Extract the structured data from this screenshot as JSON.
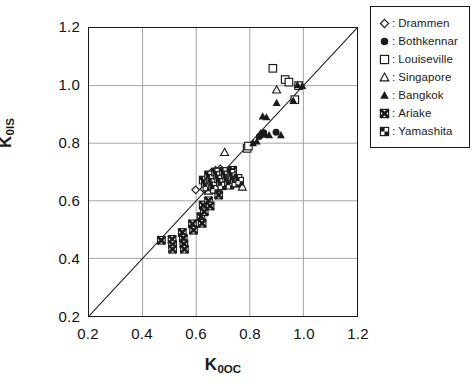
{
  "chart_data": {
    "type": "scatter",
    "title": "",
    "xlabel": "K0OC",
    "ylabel": "K0IS",
    "xlabel_base": "K",
    "xlabel_sub": "0OC",
    "ylabel_base": "K",
    "ylabel_sub": "0IS",
    "xlim": [
      0.2,
      1.2
    ],
    "ylim": [
      0.2,
      1.2
    ],
    "xticks": [
      "0.2",
      "0.4",
      "0.6",
      "0.8",
      "1.0",
      "1.2"
    ],
    "yticks": [
      "0.2",
      "0.4",
      "0.6",
      "0.8",
      "1.0",
      "1.2"
    ],
    "xtick_values": [
      0.2,
      0.4,
      0.6,
      0.8,
      1.0,
      1.2
    ],
    "ytick_values": [
      0.2,
      0.4,
      0.6,
      0.8,
      1.0,
      1.2
    ],
    "grid": true,
    "legend_position": "outside-top-right",
    "reference_line": {
      "name": "1:1 line",
      "from": [
        0.2,
        0.2
      ],
      "to": [
        1.2,
        1.2
      ]
    },
    "series": [
      {
        "name": "Drammen",
        "marker": "open-diamond",
        "points": [
          [
            0.598,
            0.638
          ],
          [
            0.628,
            0.641
          ],
          [
            0.658,
            0.7
          ],
          [
            0.672,
            0.706
          ],
          [
            0.683,
            0.697
          ],
          [
            0.69,
            0.711
          ]
        ]
      },
      {
        "name": "Bothkennar",
        "marker": "filled-circle",
        "points": [
          [
            0.742,
            0.672
          ],
          [
            0.756,
            0.669
          ],
          [
            0.836,
            0.823
          ],
          [
            0.852,
            0.836
          ],
          [
            0.898,
            0.838
          ]
        ]
      },
      {
        "name": "Louiseville",
        "marker": "open-square",
        "points": [
          [
            0.79,
            0.782
          ],
          [
            0.795,
            0.79
          ],
          [
            0.886,
            1.06
          ],
          [
            0.932,
            1.021
          ],
          [
            0.946,
            1.012
          ],
          [
            0.982,
            1.0
          ],
          [
            0.968,
            0.951
          ]
        ]
      },
      {
        "name": "Singapore",
        "marker": "open-triangle",
        "points": [
          [
            0.646,
            0.634
          ],
          [
            0.723,
            0.66
          ],
          [
            0.735,
            0.663
          ],
          [
            0.757,
            0.66
          ],
          [
            0.772,
            0.648
          ],
          [
            0.706,
            0.768
          ],
          [
            0.9,
            0.985
          ]
        ]
      },
      {
        "name": "Bangkok",
        "marker": "filled-triangle",
        "points": [
          [
            0.734,
            0.662
          ],
          [
            0.748,
            0.658
          ],
          [
            0.812,
            0.8
          ],
          [
            0.826,
            0.806
          ],
          [
            0.84,
            0.835
          ],
          [
            0.856,
            0.83
          ],
          [
            0.848,
            0.893
          ],
          [
            0.862,
            0.89
          ],
          [
            0.872,
            0.828
          ],
          [
            0.916,
            0.828
          ],
          [
            0.9,
            0.94
          ],
          [
            0.962,
            0.948
          ],
          [
            0.996,
            0.999
          ],
          [
            0.978,
            1.002
          ]
        ]
      },
      {
        "name": "Ariake",
        "marker": "crossed-square",
        "points": [
          [
            0.47,
            0.463
          ],
          [
            0.51,
            0.466
          ],
          [
            0.512,
            0.448
          ],
          [
            0.512,
            0.432
          ],
          [
            0.548,
            0.49
          ],
          [
            0.552,
            0.47
          ],
          [
            0.554,
            0.45
          ],
          [
            0.556,
            0.432
          ],
          [
            0.586,
            0.52
          ],
          [
            0.59,
            0.498
          ],
          [
            0.618,
            0.545
          ],
          [
            0.622,
            0.522
          ],
          [
            0.626,
            0.585
          ],
          [
            0.63,
            0.562
          ],
          [
            0.646,
            0.6
          ],
          [
            0.652,
            0.582
          ],
          [
            0.678,
            0.64
          ],
          [
            0.684,
            0.62
          ],
          [
            0.7,
            0.682
          ],
          [
            0.706,
            0.664
          ],
          [
            0.724,
            0.7
          ],
          [
            0.736,
            0.706
          ]
        ]
      },
      {
        "name": "Yamashita",
        "marker": "quad-square",
        "points": [
          [
            0.626,
            0.672
          ],
          [
            0.634,
            0.66
          ],
          [
            0.64,
            0.648
          ],
          [
            0.646,
            0.69
          ],
          [
            0.652,
            0.678
          ],
          [
            0.658,
            0.664
          ],
          [
            0.662,
            0.652
          ],
          [
            0.668,
            0.64
          ],
          [
            0.672,
            0.7
          ],
          [
            0.678,
            0.688
          ],
          [
            0.684,
            0.676
          ],
          [
            0.69,
            0.664
          ],
          [
            0.696,
            0.652
          ],
          [
            0.702,
            0.702
          ],
          [
            0.708,
            0.69
          ],
          [
            0.714,
            0.678
          ],
          [
            0.72,
            0.666
          ],
          [
            0.726,
            0.654
          ],
          [
            0.73,
            0.696
          ],
          [
            0.736,
            0.684
          ],
          [
            0.742,
            0.672
          ],
          [
            0.748,
            0.662
          ],
          [
            0.756,
            0.678
          ],
          [
            0.762,
            0.668
          ]
        ]
      }
    ]
  },
  "legend": {
    "items": [
      {
        "label": "Drammen",
        "marker": "open-diamond"
      },
      {
        "label": "Bothkennar",
        "marker": "filled-circle"
      },
      {
        "label": "Louiseville",
        "marker": "open-square"
      },
      {
        "label": "Singapore",
        "marker": "open-triangle"
      },
      {
        "label": "Bangkok",
        "marker": "filled-triangle"
      },
      {
        "label": "Ariake",
        "marker": "crossed-square"
      },
      {
        "label": "Yamashita",
        "marker": "quad-square"
      }
    ],
    "separator": ":"
  },
  "colors": {
    "ink": "#1a1a1a",
    "grid": "#9a9a9a",
    "background": "#ffffff"
  }
}
